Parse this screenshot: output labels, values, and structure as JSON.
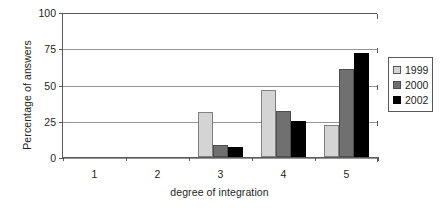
{
  "chart_data": {
    "type": "bar",
    "title": "",
    "xlabel": "degree of integration",
    "ylabel": "Percentage of answers",
    "categories": [
      "1",
      "2",
      "3",
      "4",
      "5"
    ],
    "ylim": [
      0,
      100
    ],
    "yticks": [
      0,
      25,
      50,
      75,
      100
    ],
    "ytick_labels": [
      "0",
      "25",
      "50",
      "75",
      "100"
    ],
    "grid": true,
    "legend_position": "right",
    "series": [
      {
        "name": "1999",
        "color": "#d4d4d4",
        "values": [
          0,
          0,
          31,
          46,
          22
        ]
      },
      {
        "name": "2000",
        "color": "#707070",
        "values": [
          0,
          0,
          8,
          32,
          61
        ]
      },
      {
        "name": "2002",
        "color": "#000000",
        "values": [
          0,
          0,
          7,
          25,
          72
        ]
      }
    ]
  },
  "legend": {
    "items": [
      {
        "label": "1999"
      },
      {
        "label": "2000"
      },
      {
        "label": "2002"
      }
    ]
  }
}
